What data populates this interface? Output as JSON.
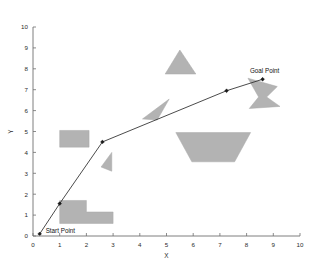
{
  "figure": {
    "background_color": "#ffffff",
    "width": 323,
    "height": 264
  },
  "chart_data": {
    "type": "scatter",
    "title": "",
    "xlabel": "X",
    "ylabel": "Y",
    "xlim": [
      0,
      10
    ],
    "ylim": [
      0,
      10
    ],
    "xticks": [
      0,
      1,
      2,
      3,
      4,
      5,
      6,
      7,
      8,
      9,
      10
    ],
    "yticks": [
      0,
      1,
      2,
      3,
      4,
      5,
      6,
      7,
      8,
      9,
      10
    ],
    "xtick_labels": [
      "0",
      "1",
      "2",
      "3",
      "4",
      "5",
      "6",
      "7",
      "8",
      "9",
      "10"
    ],
    "ytick_labels": [
      "0",
      "1",
      "2",
      "3",
      "4",
      "5",
      "6",
      "7",
      "8",
      "9",
      "10"
    ],
    "grid": false,
    "legend": null,
    "axis_color": "#6f6f6f",
    "obstacle_color": "#b3b3b3",
    "path_color": "#2a2a2a",
    "series": [
      {
        "name": "planned-path",
        "kind": "polyline-with-markers",
        "x": [
          0.25,
          1.0,
          2.6,
          7.25,
          8.6
        ],
        "y": [
          0.1,
          1.55,
          4.5,
          6.95,
          7.5
        ]
      }
    ],
    "annotations": [
      {
        "name": "start-point",
        "label": "Start Point",
        "x": 0.25,
        "y": 0.1
      },
      {
        "name": "goal-point",
        "label": "Goal Point",
        "x": 8.6,
        "y": 7.5
      }
    ],
    "obstacles": [
      {
        "name": "obstacle-rect-left",
        "shape": "rectangle",
        "points": [
          [
            1.0,
            4.25
          ],
          [
            2.1,
            4.25
          ],
          [
            2.1,
            5.05
          ],
          [
            1.0,
            5.05
          ]
        ]
      },
      {
        "name": "obstacle-l-shape-bottom",
        "shape": "l-polygon",
        "points": [
          [
            1.0,
            0.6
          ],
          [
            3.0,
            0.6
          ],
          [
            3.0,
            1.15
          ],
          [
            2.0,
            1.15
          ],
          [
            2.0,
            1.7
          ],
          [
            1.0,
            1.7
          ]
        ]
      },
      {
        "name": "obstacle-wedge-left-pointing",
        "shape": "triangle-wedge",
        "points": [
          [
            2.55,
            3.3
          ],
          [
            2.95,
            3.1
          ],
          [
            2.95,
            4.0
          ]
        ]
      },
      {
        "name": "obstacle-triangle-top",
        "shape": "triangle",
        "points": [
          [
            5.5,
            8.9
          ],
          [
            4.95,
            7.75
          ],
          [
            6.1,
            7.75
          ]
        ]
      },
      {
        "name": "obstacle-sliver",
        "shape": "thin-triangle",
        "points": [
          [
            5.1,
            6.55
          ],
          [
            4.1,
            5.6
          ],
          [
            4.65,
            5.55
          ]
        ]
      },
      {
        "name": "obstacle-trapezoid",
        "shape": "trapezoid",
        "points": [
          [
            5.35,
            4.95
          ],
          [
            8.15,
            4.95
          ],
          [
            7.55,
            3.55
          ],
          [
            5.95,
            3.55
          ]
        ]
      },
      {
        "name": "obstacle-zigzag-goal",
        "shape": "zigzag-polygon",
        "points": [
          [
            8.05,
            7.55
          ],
          [
            9.15,
            7.15
          ],
          [
            8.75,
            6.65
          ],
          [
            9.25,
            6.2
          ],
          [
            8.1,
            6.1
          ],
          [
            8.45,
            6.65
          ]
        ]
      }
    ]
  }
}
